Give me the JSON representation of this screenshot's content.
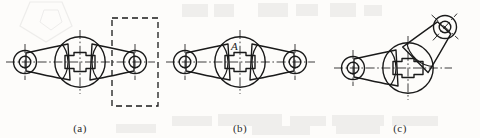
{
  "document": {
    "type": "engineering-drawing",
    "subject": "three-lobed rocker arm / lever link",
    "background_color": "#fdfcfa",
    "line_color": "#1a1a1a",
    "width": 480,
    "height": 138
  },
  "figures": [
    {
      "id": "a",
      "caption": "(a)",
      "description": "Front view of rocker arm with dashed selection rectangle around right boss",
      "has_dashed_box": true,
      "has_label": false,
      "label": "",
      "right_arm_angle_deg": 0,
      "dashed_box": {
        "x": 112,
        "y": 18,
        "width": 46,
        "height": 88
      }
    },
    {
      "id": "b",
      "caption": "(b)",
      "description": "Front view of rocker arm with reference letter A at central hub",
      "has_dashed_box": false,
      "has_label": true,
      "label": "A",
      "right_arm_angle_deg": 0
    },
    {
      "id": "c",
      "caption": "(c)",
      "description": "Rocker arm with right arm rotated upward about central hub",
      "has_dashed_box": false,
      "has_label": false,
      "label": "",
      "right_arm_angle_deg": -48
    }
  ],
  "geometry": {
    "hub_outer_radius": 26,
    "hub_keyway_width": 30,
    "hub_keyway_height": 13,
    "boss_outer_radius": 12,
    "boss_inner_radius": 6,
    "centerline_style": "dash-dot",
    "outline_stroke_width": 1.4
  },
  "annotations": {
    "reference_letter": "A",
    "caption_a": "(a)",
    "caption_b": "(b)",
    "caption_c": "(c)"
  }
}
